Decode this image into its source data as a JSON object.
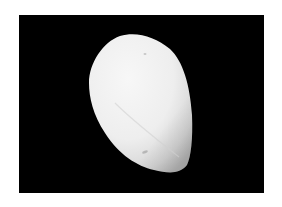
{
  "image": {
    "subject": "white seed kernel",
    "alt": "A single white oval seed kernel photographed on a black background",
    "colors": {
      "page_background": "#ffffff",
      "photo_background": "#000000",
      "subject_highlight": "#f4f4f4",
      "subject_shadow": "#c8c8c8"
    }
  }
}
